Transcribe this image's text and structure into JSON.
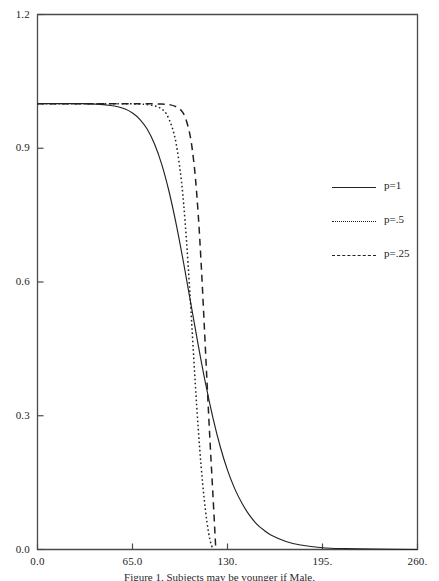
{
  "chart_data": {
    "type": "line",
    "title": "",
    "subtitle": "",
    "xlabel": "",
    "ylabel": "",
    "xlim": [
      0,
      260
    ],
    "ylim": [
      0,
      1.2
    ],
    "grid": false,
    "legend_position": "right",
    "x_ticks": [
      "0.0",
      "65.0",
      "130.",
      "195.",
      "260."
    ],
    "x_tick_values": [
      0,
      65,
      130,
      195,
      260
    ],
    "y_ticks": [
      "0.0",
      "0.3",
      "0.6",
      "0.9",
      "1.2"
    ],
    "y_tick_values": [
      0.0,
      0.3,
      0.6,
      0.9,
      1.2
    ],
    "series": [
      {
        "name": "p=1",
        "style": "solid",
        "color": "#222222",
        "x": [
          0,
          10,
          20,
          30,
          40,
          50,
          55,
          60,
          65,
          70,
          75,
          80,
          85,
          90,
          95,
          100,
          105,
          110,
          115,
          120,
          125,
          130,
          135,
          140,
          145,
          150,
          155,
          160,
          170,
          180,
          195,
          210,
          230,
          260
        ],
        "y": [
          1.0,
          1.0,
          1.0,
          1.0,
          0.999,
          0.996,
          0.993,
          0.988,
          0.979,
          0.965,
          0.943,
          0.91,
          0.864,
          0.803,
          0.728,
          0.642,
          0.55,
          0.458,
          0.372,
          0.296,
          0.231,
          0.178,
          0.136,
          0.103,
          0.077,
          0.057,
          0.043,
          0.032,
          0.018,
          0.01,
          0.004,
          0.002,
          0.001,
          0.0
        ]
      },
      {
        "name": "p=.5",
        "style": "dotted",
        "color": "#222222",
        "x": [
          0,
          20,
          40,
          60,
          70,
          75,
          80,
          84,
          88,
          92,
          95,
          98,
          100,
          102,
          104,
          106,
          108,
          110,
          112,
          114,
          116,
          118,
          120
        ],
        "y": [
          1.0,
          1.0,
          1.0,
          1.0,
          0.999,
          0.998,
          0.995,
          0.99,
          0.978,
          0.948,
          0.908,
          0.84,
          0.775,
          0.69,
          0.59,
          0.48,
          0.37,
          0.27,
          0.185,
          0.115,
          0.06,
          0.022,
          0.0
        ]
      },
      {
        "name": "p=.25",
        "style": "dashed",
        "color": "#222222",
        "x": [
          0,
          20,
          40,
          60,
          75,
          85,
          90,
          95,
          98,
          101,
          104,
          106,
          108,
          110,
          112,
          114,
          116,
          118,
          120,
          122
        ],
        "y": [
          1.0,
          1.0,
          1.0,
          1.0,
          1.0,
          0.999,
          0.998,
          0.993,
          0.986,
          0.97,
          0.935,
          0.895,
          0.835,
          0.75,
          0.64,
          0.51,
          0.375,
          0.245,
          0.125,
          0.0
        ]
      }
    ]
  },
  "legend": {
    "entries": [
      {
        "label": "p=1"
      },
      {
        "label": "p=.5"
      },
      {
        "label": "p=.25"
      }
    ]
  },
  "caption": {
    "text": "Figure 1. Subjects may be younger if Male."
  },
  "axis": {
    "frame_color": "#4a4a4a"
  }
}
